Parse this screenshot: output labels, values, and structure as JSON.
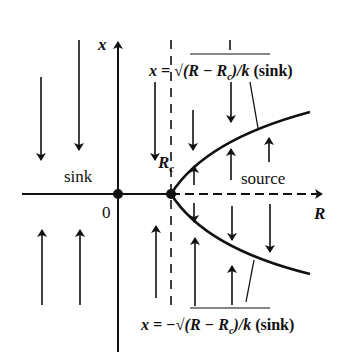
{
  "diagram": {
    "type": "bifurcation-phase-diagram",
    "axes": {
      "horizontal_label": "R",
      "vertical_label": "x",
      "origin_label": "0"
    },
    "critical_point_label_main": "R",
    "critical_point_label_sub": "c",
    "region_labels": {
      "left": "sink",
      "right": "source"
    },
    "upper_branch": {
      "prefix": "x = ",
      "radical": "√",
      "expr_a": "(R − R",
      "expr_sub": "c",
      "expr_b": ")/k",
      "suffix": " (sink)",
      "full": "x = √((R − Rc)/k) (sink)"
    },
    "lower_branch": {
      "prefix": "x = −",
      "radical": "√",
      "expr_a": "(R − R",
      "expr_sub": "c",
      "expr_b": ")/k",
      "suffix": " (sink)",
      "full": "x = −√((R − Rc)/k) (sink)"
    },
    "colors": {
      "ink": "#111111",
      "background": "#ffffff"
    }
  }
}
